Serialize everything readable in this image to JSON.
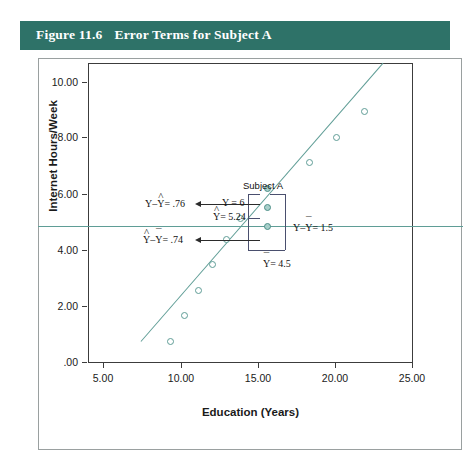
{
  "figure": {
    "number": "Figure 11.6",
    "title": "Error Terms for Subject A",
    "banner_color": "#2e7268"
  },
  "chart_data": {
    "type": "scatter",
    "title": "Error Terms for Subject A",
    "xlabel": "Education (Years)",
    "ylabel": "Internet Hours/Week",
    "xlim": [
      3.0,
      26.5
    ],
    "ylim": [
      -0.85,
      10.9
    ],
    "xticks": [
      "5.00",
      "10.00",
      "15.00",
      "20.00",
      "25.00"
    ],
    "xtick_values": [
      5,
      10,
      15,
      20,
      25
    ],
    "yticks": [
      ".00",
      "2.00",
      "4.00",
      "6.00",
      "8.00",
      "10.00"
    ],
    "ytick_values": [
      0,
      2,
      4,
      6,
      8,
      10
    ],
    "grid": false,
    "legend": "none",
    "marker_color": "#5f9d96",
    "line_color": "#5f9d96",
    "points": [
      {
        "x": 9.0,
        "y": 0.0,
        "label": "",
        "filled": false
      },
      {
        "x": 10.0,
        "y": 1.0,
        "label": "",
        "filled": false
      },
      {
        "x": 11.0,
        "y": 2.0,
        "label": "",
        "filled": false
      },
      {
        "x": 12.0,
        "y": 3.0,
        "label": "",
        "filled": false
      },
      {
        "x": 13.0,
        "y": 4.0,
        "label": "",
        "filled": false
      },
      {
        "x": 14.0,
        "y": 4.8,
        "label": "",
        "filled": false
      },
      {
        "x": 16.0,
        "y": 4.5,
        "label": "Y-bar",
        "filled": true
      },
      {
        "x": 16.0,
        "y": 5.24,
        "label": "Y-hat",
        "filled": true
      },
      {
        "x": 16.0,
        "y": 6.0,
        "label": "Subject A observed Y",
        "filled": true
      },
      {
        "x": 19.0,
        "y": 7.0,
        "label": "",
        "filled": false
      },
      {
        "x": 21.0,
        "y": 8.0,
        "label": "",
        "filled": false
      },
      {
        "x": 23.0,
        "y": 9.0,
        "label": "",
        "filled": false
      }
    ],
    "regression_line": {
      "x1": 6.8,
      "y1": 0.0,
      "x2": 24.3,
      "y2": 10.9
    },
    "mean_line": {
      "y": 4.5,
      "label": "Y-bar = 4.5"
    },
    "annotations": {
      "subject_label": "Subject A",
      "observed_y": "Y = 6",
      "predicted_y": "= 5.24",
      "mean_y": "= 4.5",
      "residual": "= .76",
      "regression_effect": "= .74",
      "total_deviation": "= 1.5",
      "residual_prefix": "Y–",
      "regression_effect_parts": [
        "Y",
        "Y"
      ],
      "total_deviation_prefix": "Y–"
    }
  }
}
